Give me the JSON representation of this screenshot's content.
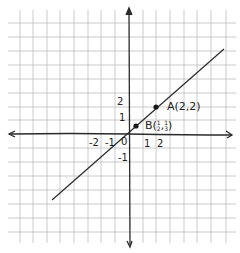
{
  "diagram": {
    "type": "hand-drawn coordinate plane with line",
    "grid_color": "#b8b8b8",
    "ink_color": "#2a2a2a",
    "x_axis_ticks": [
      "-2",
      "-1",
      "1",
      "2"
    ],
    "y_axis_ticks": [
      "2",
      "1",
      "-1"
    ],
    "origin_label": "0",
    "points": [
      {
        "name": "A",
        "label": "A(2,2)",
        "x": 2,
        "y": 2
      },
      {
        "name": "B",
        "label_prefix": "B(",
        "x_num": "1",
        "x_den": "2",
        "sep": ",",
        "y_num": "1",
        "y_den": "3",
        "label_suffix": ")",
        "x": 0.5,
        "y": 0.33
      }
    ],
    "line": {
      "description": "line through origin and A(2,2)",
      "slope": 1,
      "intercept": 0
    }
  }
}
